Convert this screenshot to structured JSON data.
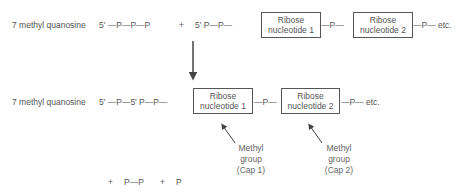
{
  "row1": {
    "prefix": "7 methyl quanosine",
    "chain_a": "5' —P—P—P",
    "plus": "+",
    "chain_b": "5' P—P—",
    "box1": [
      "Ribose",
      "nucleotide 1"
    ],
    "link1": "—P—",
    "box2": [
      "Ribose",
      "nucleotide 2"
    ],
    "tail": "—P— etc."
  },
  "row2": {
    "prefix": "7 methyl quanosine",
    "chain": "5' —P—5' P—P—",
    "box1": [
      "Ribose",
      "nucleotide 1"
    ],
    "link1": "—P—",
    "box2": [
      "Ribose",
      "nucleotide 2"
    ],
    "tail": "—P— etc."
  },
  "annotations": {
    "cap1": [
      "Methyl",
      "group",
      "(Cap 1)"
    ],
    "cap2": [
      "Methyl",
      "group",
      "(Cap 2)"
    ]
  },
  "byproducts": {
    "plus1": "+",
    "pp": "P—P",
    "plus2": "+",
    "p": "P"
  }
}
